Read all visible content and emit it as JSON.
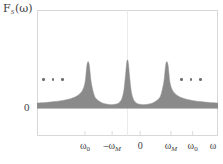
{
  "figure": {
    "name": "spectral-density-plot",
    "background": "#ffffff",
    "frame_color": "#d8d8d8",
    "fill_color": "#8a8a8a",
    "text_color": "#3d3d3d"
  },
  "axes": {
    "ylabel": {
      "main": "F",
      "sub": "S",
      "arg": "(ω)"
    },
    "y_zero_label": "0",
    "x_axis_symbol": "ω"
  },
  "xticks": [
    {
      "id": "tick-omega0-neg",
      "main": "ω",
      "sub": "0",
      "sub_italic": false,
      "prefix": "",
      "x_pct": 26.5
    },
    {
      "id": "tick-omegaM-neg",
      "main": "ω",
      "sub": "M",
      "sub_italic": true,
      "prefix": "–",
      "x_pct": 41.5
    },
    {
      "id": "tick-zero",
      "main": "0",
      "sub": "",
      "sub_italic": false,
      "prefix": "",
      "x_pct": 57.0
    },
    {
      "id": "tick-omegaM-pos",
      "main": "ω",
      "sub": "M",
      "sub_italic": true,
      "prefix": "",
      "x_pct": 74.0
    },
    {
      "id": "tick-omega0-pos",
      "main": "ω",
      "sub": "0",
      "sub_italic": false,
      "prefix": "",
      "x_pct": 86.0
    }
  ],
  "ellipsis": {
    "left_label": "• • •",
    "right_label": "• • •",
    "dot_count": 3
  },
  "chart_data": {
    "type": "area",
    "title": "",
    "xlabel": "ω",
    "ylabel": "F_S(ω)",
    "grid": false,
    "legend": null,
    "xlim": [
      -1.0,
      1.0
    ],
    "ylim": [
      0,
      1.0
    ],
    "peaks": [
      {
        "label": "–ω₀",
        "center": -0.435,
        "height": 0.8,
        "halfwidth": 0.055
      },
      {
        "label": "0",
        "center": 0.0,
        "height": 0.83,
        "halfwidth": 0.048
      },
      {
        "label": "ω₀",
        "center": 0.435,
        "height": 0.8,
        "halfwidth": 0.055
      }
    ],
    "baseline": 0.0,
    "series": [
      {
        "name": "F_S(ω)",
        "x": [
          -1.0,
          -0.9,
          -0.8,
          -0.7,
          -0.62,
          -0.56,
          -0.5,
          -0.47,
          -0.4575,
          -0.4475,
          -0.435,
          -0.4225,
          -0.4125,
          -0.4,
          -0.37,
          -0.34,
          -0.29,
          -0.24,
          -0.18,
          -0.12,
          -0.085,
          -0.06,
          -0.04,
          -0.022,
          -0.01,
          0.0,
          0.01,
          0.022,
          0.04,
          0.06,
          0.085,
          0.12,
          0.18,
          0.24,
          0.29,
          0.34,
          0.37,
          0.4,
          0.4125,
          0.4225,
          0.435,
          0.4475,
          0.4575,
          0.47,
          0.5,
          0.56,
          0.62,
          0.7,
          0.8,
          0.9,
          1.0
        ],
        "values": [
          0.085,
          0.095,
          0.11,
          0.135,
          0.165,
          0.205,
          0.295,
          0.43,
          0.6,
          0.74,
          0.8,
          0.74,
          0.6,
          0.43,
          0.23,
          0.15,
          0.095,
          0.07,
          0.058,
          0.07,
          0.105,
          0.17,
          0.3,
          0.56,
          0.76,
          0.83,
          0.76,
          0.56,
          0.3,
          0.17,
          0.105,
          0.07,
          0.058,
          0.07,
          0.095,
          0.15,
          0.23,
          0.43,
          0.6,
          0.74,
          0.8,
          0.74,
          0.6,
          0.43,
          0.295,
          0.205,
          0.165,
          0.135,
          0.11,
          0.095,
          0.085
        ]
      }
    ]
  }
}
